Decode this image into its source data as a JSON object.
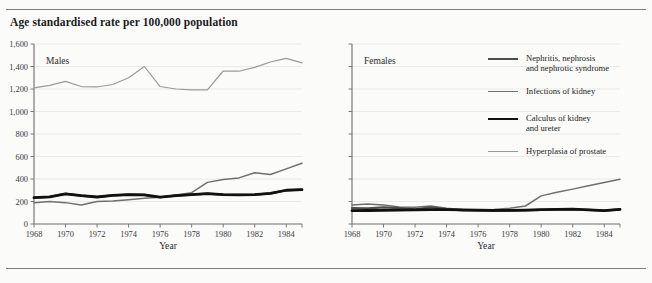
{
  "figure": {
    "title": "Age standardised rate per 100,000 population",
    "rule_color": "#7e7e7e",
    "background": "#fbfbfa"
  },
  "panels": [
    {
      "key": "males",
      "label": "Males",
      "xlabel": "Year"
    },
    {
      "key": "females",
      "label": "Females",
      "xlabel": "Year"
    }
  ],
  "legend": {
    "items": [
      {
        "name": "Nephritis, nephrosis and nephrotic syndrome",
        "lines": [
          "Nephritis, nephrosis",
          "and nephrotic syndrome"
        ],
        "color": "#4d4d4d",
        "width": 2.2
      },
      {
        "name": "Infections of kidney",
        "lines": [
          "Infections of kidney"
        ],
        "color": "#6f6f6f",
        "width": 1.5
      },
      {
        "name": "Calculus of kidney and ureter",
        "lines": [
          "Calculus of kidney",
          "and ureter"
        ],
        "color": "#111111",
        "width": 2.8
      },
      {
        "name": "Hyperplasia of prostate",
        "lines": [
          "Hyperplasia of prostate"
        ],
        "color": "#9a9a9a",
        "width": 1.2
      }
    ]
  },
  "chart_data": {
    "type": "line",
    "title": "Age standardised rate per 100,000 population",
    "xlabel": "Year",
    "ylabel": "Age standardised rate per 100,000 population",
    "xlim": [
      1968,
      1985
    ],
    "ylim": [
      0,
      1600
    ],
    "ytick_values": [
      0,
      200,
      400,
      600,
      800,
      1000,
      1200,
      1400,
      1600
    ],
    "ytick_labels": [
      "0",
      "200",
      "400",
      "600",
      "800",
      "1,000",
      "1,200",
      "1,400",
      "1,600"
    ],
    "xtick_values": [
      1968,
      1970,
      1972,
      1974,
      1976,
      1978,
      1980,
      1982,
      1984
    ],
    "xtick_labels": [
      "1968",
      "1970",
      "1972",
      "1974",
      "1976",
      "1978",
      "1980",
      "1982",
      "1984"
    ],
    "grid": "horizontal",
    "legend_position": "right",
    "x": [
      1968,
      1969,
      1970,
      1971,
      1972,
      1973,
      1974,
      1975,
      1976,
      1977,
      1978,
      1979,
      1980,
      1981,
      1982,
      1983,
      1984,
      1985
    ],
    "panels": [
      {
        "name": "Males",
        "series": [
          {
            "name": "Nephritis, nephrosis and nephrotic syndrome",
            "color": "#4d4d4d",
            "width": 2.2,
            "values": [
              235,
              242,
              268,
              252,
              240,
              255,
              262,
              258,
              238,
              252,
              262,
              270,
              262,
              258,
              262,
              272,
              300,
              305
            ]
          },
          {
            "name": "Infections of kidney",
            "color": "#6f6f6f",
            "width": 1.5,
            "values": [
              188,
              200,
              190,
              168,
              200,
              205,
              215,
              228,
              238,
              258,
              278,
              370,
              395,
              410,
              455,
              440,
              490,
              540
            ]
          },
          {
            "name": "Calculus of kidney and ureter",
            "color": "#111111",
            "width": 2.8,
            "values": [
              235,
              242,
              268,
              252,
              240,
              255,
              262,
              258,
              238,
              252,
              262,
              270,
              262,
              258,
              262,
              272,
              300,
              305
            ]
          },
          {
            "name": "Hyperplasia of prostate",
            "color": "#9a9a9a",
            "width": 1.2,
            "values": [
              1210,
              1232,
              1268,
              1222,
              1218,
              1240,
              1300,
              1400,
              1222,
              1200,
              1192,
              1192,
              1360,
              1358,
              1392,
              1440,
              1472,
              1432
            ]
          }
        ]
      },
      {
        "name": "Females",
        "series": [
          {
            "name": "Nephritis, nephrosis and nephrotic syndrome",
            "color": "#4d4d4d",
            "width": 2.2,
            "values": [
              142,
              138,
              148,
              142,
              130,
              148,
              132,
              122,
              118,
              116,
              118,
              122,
              125,
              128,
              130,
              125,
              118,
              130
            ]
          },
          {
            "name": "Infections of kidney",
            "color": "#6f6f6f",
            "width": 1.5,
            "values": [
              168,
              178,
              168,
              152,
              150,
              160,
              140,
              128,
              122,
              128,
              140,
              160,
              250,
              282,
              310,
              340,
              368,
              398
            ]
          },
          {
            "name": "Calculus of kidney and ureter",
            "color": "#111111",
            "width": 2.8,
            "values": [
              118,
              120,
              122,
              124,
              126,
              128,
              128,
              126,
              124,
              122,
              122,
              124,
              128,
              130,
              132,
              126,
              118,
              130
            ]
          },
          {
            "name": "Hyperplasia of prostate",
            "color": "#9a9a9a",
            "width": 1.2,
            "values": [
              null,
              null,
              null,
              null,
              null,
              null,
              null,
              null,
              null,
              null,
              null,
              null,
              null,
              null,
              null,
              null,
              null,
              null
            ]
          }
        ]
      }
    ]
  }
}
